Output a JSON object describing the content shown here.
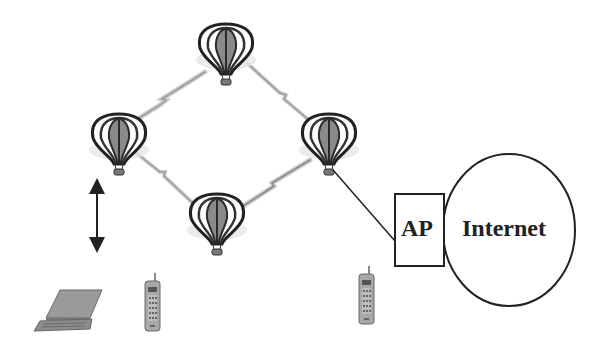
{
  "diagram": {
    "type": "wireless mesh network",
    "nodes": {
      "balloons": [
        {
          "id": "balloon-top",
          "cx": 226,
          "cy": 50
        },
        {
          "id": "balloon-left",
          "cx": 119,
          "cy": 140
        },
        {
          "id": "balloon-right",
          "cx": 329,
          "cy": 140
        },
        {
          "id": "balloon-bottom",
          "cx": 217,
          "cy": 220
        }
      ],
      "access_point": {
        "label": "AP"
      },
      "internet": {
        "label": "Internet"
      },
      "devices": [
        {
          "id": "laptop",
          "kind": "laptop-icon"
        },
        {
          "id": "phone-left",
          "kind": "mobile-phone-icon"
        },
        {
          "id": "phone-right",
          "kind": "mobile-phone-icon"
        }
      ]
    },
    "links": [
      {
        "from": "balloon-left",
        "to": "balloon-top",
        "style": "wireless"
      },
      {
        "from": "balloon-top",
        "to": "balloon-right",
        "style": "wireless"
      },
      {
        "from": "balloon-left",
        "to": "balloon-bottom",
        "style": "wireless"
      },
      {
        "from": "balloon-bottom",
        "to": "balloon-right",
        "style": "wireless"
      },
      {
        "from": "balloon-right",
        "to": "access_point",
        "style": "wired"
      },
      {
        "from": "access_point",
        "to": "internet",
        "style": "adjacent"
      }
    ],
    "annotations": [
      {
        "kind": "double-arrow-vertical",
        "meaning": "altitude"
      }
    ],
    "colors": {
      "line": "#222222",
      "wireless_link": "#b0b0b0",
      "balloon_stripe_dark": "#2a2a2a",
      "balloon_stripe_mid": "#8a8a8a",
      "device_gray": "#9a9a9a"
    }
  }
}
